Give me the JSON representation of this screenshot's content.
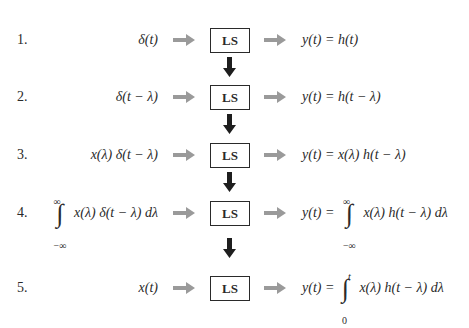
{
  "diagram": {
    "block_label": "LS",
    "colors": {
      "input_arrow": "#9a9a9a",
      "down_arrow": "#1e1e1e",
      "box_border": "#2a2a2a",
      "text": "#2a2a2a"
    },
    "rows": [
      {
        "number": "1.",
        "input": "δ(t)",
        "output": "y(t) = h(t)"
      },
      {
        "number": "2.",
        "input": "δ(t − λ)",
        "output": "y(t) = h(t − λ)"
      },
      {
        "number": "3.",
        "input": "x(λ) δ(t − λ)",
        "output": "y(t) = x(λ) h(t − λ)"
      },
      {
        "number": "4.",
        "input_integral": {
          "upper": "∞",
          "lower": "−∞",
          "integrand": "x(λ) δ(t − λ) dλ"
        },
        "output_prefix": "y(t) =",
        "output_integral": {
          "upper": "∞",
          "lower": "−∞",
          "integrand": "x(λ) h(t − λ) dλ"
        }
      },
      {
        "number": "5.",
        "input": "x(t)",
        "output_prefix": "y(t) =",
        "output_integral": {
          "upper": "t",
          "lower": "0",
          "integrand": "x(λ) h(t − λ) dλ"
        }
      }
    ]
  }
}
